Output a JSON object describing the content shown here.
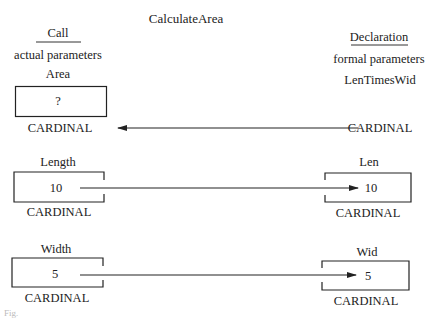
{
  "title": "CalculateArea",
  "left_header": {
    "heading": "Call",
    "subheading": "actual parameters"
  },
  "right_header": {
    "heading": "Declaration",
    "subheading": "formal parameters"
  },
  "actual": [
    {
      "name": "Area",
      "value": "?",
      "type": "CARDINAL"
    },
    {
      "name": "Length",
      "value": "10",
      "type": "CARDINAL"
    },
    {
      "name": "Width",
      "value": "5",
      "type": "CARDINAL"
    }
  ],
  "formal": [
    {
      "name": "LenTimesWid",
      "value": "",
      "type": "CARDINAL"
    },
    {
      "name": "Len",
      "value": "10",
      "type": "CARDINAL"
    },
    {
      "name": "Wid",
      "value": "5",
      "type": "CARDINAL"
    }
  ],
  "caption": "Fig."
}
